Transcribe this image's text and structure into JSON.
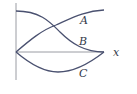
{
  "diagram": {
    "axis_label_x": "x",
    "curves": [
      {
        "label": "A",
        "description": "rises from origin to top right"
      },
      {
        "label": "B",
        "description": "falls from top left to x-axis end"
      },
      {
        "label": "C",
        "description": "dips below x-axis and returns"
      }
    ],
    "colors": {
      "curve": "#4a5170",
      "axis": "#9a9ca3",
      "text": "#333a4a"
    }
  }
}
